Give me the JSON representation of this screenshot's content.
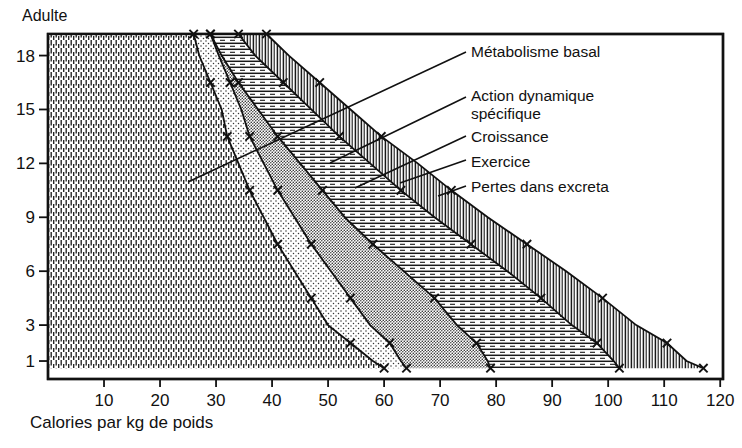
{
  "figure": {
    "top_label": "Adulte",
    "xlabel": "Calories par kg de poids",
    "ylabel": ""
  },
  "annotations": [
    {
      "id": "metabolisme",
      "label": "Métabolisme  basal",
      "line2": ""
    },
    {
      "id": "adspecifique",
      "label": "Action   dynamique",
      "line2": "spécifique"
    },
    {
      "id": "croissance",
      "label": "Croissance",
      "line2": ""
    },
    {
      "id": "exercice",
      "label": "Exercice",
      "line2": ""
    },
    {
      "id": "pertes",
      "label": "Pertes dans excreta",
      "line2": ""
    }
  ],
  "axes": {
    "x_ticks": [
      "10",
      "20",
      "30",
      "40",
      "50",
      "60",
      "70",
      "80",
      "90",
      "100",
      "110",
      "120"
    ],
    "x_tick_values": [
      10,
      20,
      30,
      40,
      50,
      60,
      70,
      80,
      90,
      100,
      110,
      120
    ],
    "x_min": 0,
    "x_max": 120.5,
    "y_ticks": [
      "1",
      "3",
      "6",
      "9",
      "12",
      "15",
      "18"
    ],
    "y_tick_values": [
      1,
      3,
      6,
      9,
      12,
      15,
      18
    ],
    "y_min": 0,
    "y_max": 19.2
  },
  "chart_data": {
    "type": "area",
    "title": "",
    "subtitle": "",
    "xlabel": "Calories par kg de poids",
    "ylabel": "Âge (années)",
    "xlim": [
      0,
      120.5
    ],
    "ylim": [
      0,
      19.2
    ],
    "grid": false,
    "legend_position": "right-inline-annotations",
    "orientation": "horizontal-stacked",
    "note": "Stacked horizontal areas: cumulative calories per kg body weight by age. y = age in years (0.6 = infant 1 yr row, 19.2 = Adulte).",
    "ages": [
      19.2,
      18,
      16.5,
      15,
      13.5,
      12,
      10.5,
      9,
      7.5,
      6,
      4.5,
      3,
      2,
      1,
      0.6
    ],
    "series": [
      {
        "name": "Métabolisme basal",
        "pattern": "vertical-dash-hatch",
        "cumulative": [
          26,
          27,
          29,
          31,
          32,
          34,
          36,
          38.5,
          41,
          44,
          47,
          50,
          54,
          58,
          60
        ]
      },
      {
        "name": "Action dynamique spécifique",
        "pattern": "dotted-stipple",
        "cumulative": [
          29,
          30.5,
          32.5,
          34.5,
          36,
          38.5,
          41,
          44,
          47,
          50.5,
          54,
          57.5,
          61,
          63,
          64
        ]
      },
      {
        "name": "Croissance",
        "pattern": "fine-dot-screen",
        "cumulative": [
          29,
          31,
          34,
          37.5,
          41,
          45,
          49,
          53,
          58,
          63.5,
          69,
          73,
          76.5,
          78.5,
          79
        ]
      },
      {
        "name": "Exercice",
        "pattern": "horizontal-line-hatch",
        "cumulative": [
          34,
          37,
          42,
          47,
          52,
          57.5,
          63,
          69,
          75.5,
          82,
          88,
          93.5,
          98,
          101,
          102
        ]
      },
      {
        "name": "Pertes dans excreta",
        "pattern": "vertical-line-hatch",
        "cumulative": [
          39,
          43,
          48.5,
          54,
          59.5,
          66,
          72,
          78.5,
          85.5,
          92.5,
          99,
          105,
          110.5,
          114,
          117
        ]
      }
    ],
    "markers": {
      "symbol": "x",
      "description": "× markers placed along each cumulative boundary curve"
    }
  },
  "colors": {
    "ink": "#111111",
    "background": "#ffffff",
    "band_metabolisme": "#ffffff",
    "band_action": "#ffffff",
    "band_croissance": "#e8e8e8",
    "band_exercice": "#ffffff",
    "band_pertes": "#ffffff"
  }
}
